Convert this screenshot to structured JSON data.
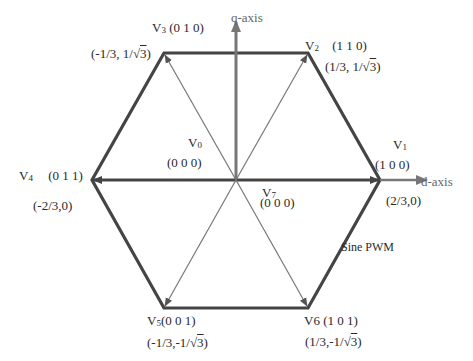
{
  "diagram": {
    "type": "space-vector-hexagon",
    "axes": {
      "d": "d-axis",
      "q": "q-axis"
    },
    "annotation": "Sine PWM",
    "colors": {
      "hexagon": "#444444",
      "vectors": "#555555",
      "spokes": "#888888",
      "axes": "#777777",
      "text": "#2a2a2a"
    },
    "vectors": [
      {
        "name": "V",
        "index": "1",
        "state": "(1 0 0)",
        "coord": "(2/3,0)"
      },
      {
        "name": "V",
        "index": "2",
        "state": "(1 1 0)",
        "coord_prefix": "(1/3, 1/",
        "coord_root": "3",
        "coord_suffix": ")"
      },
      {
        "name": "V",
        "index": "3",
        "state": "(0 1 0)",
        "coord_prefix": "(-1/3, 1/",
        "coord_root": "3",
        "coord_suffix": ")"
      },
      {
        "name": "V",
        "index": "4",
        "state": "(0 1 1)",
        "coord": "(-2/3,0)"
      },
      {
        "name": "V",
        "index": "5",
        "state": "(0 0 1)",
        "coord_prefix": "(-1/3,-1/",
        "coord_root": "3",
        "coord_suffix": ")"
      },
      {
        "name": "V",
        "index": "6",
        "state": "(1 0 1)",
        "coord_prefix": "(1/3,-1/",
        "coord_root": "3",
        "coord_suffix": ")"
      }
    ],
    "null_vectors": [
      {
        "name": "V",
        "index": "0",
        "state": "(0 0 0)"
      },
      {
        "name": "V",
        "index": "7",
        "state": "(0 0 0)"
      }
    ]
  }
}
